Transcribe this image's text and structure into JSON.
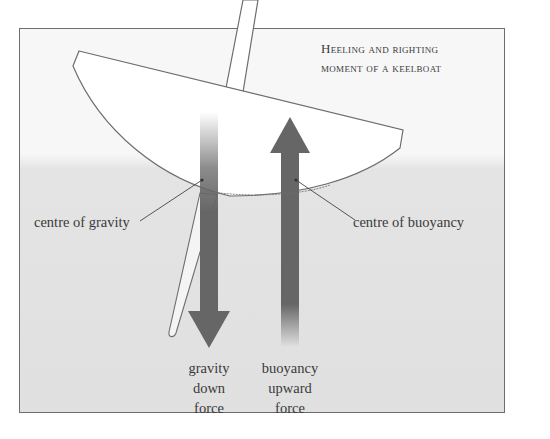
{
  "title": {
    "line1": "Heeling and righting",
    "line2": "moment of a keelboat"
  },
  "labels": {
    "centre_of_gravity": "centre of gravity",
    "centre_of_buoyancy": "centre of buoyancy"
  },
  "forces": {
    "gravity": [
      "gravity",
      "down",
      "force"
    ],
    "buoyancy": [
      "buoyancy",
      "upward",
      "force"
    ]
  },
  "colors": {
    "arrow": "#666666",
    "air": "#f7f7f7",
    "water": "#e0e0e0",
    "hull_fill": "#ffffff",
    "outline": "#6d6d6d",
    "text": "#3a3a3a"
  }
}
